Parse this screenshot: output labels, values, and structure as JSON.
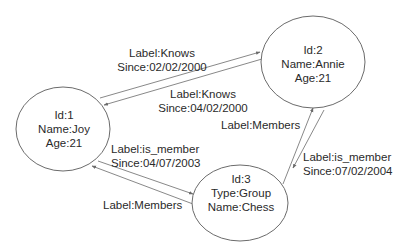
{
  "diagram": {
    "type": "property-graph",
    "nodes": [
      {
        "id": "1",
        "lines": [
          "Id:1",
          "Name:Joy",
          "Age:21"
        ]
      },
      {
        "id": "2",
        "lines": [
          "Id:2",
          "Name:Annie",
          "Age:21"
        ]
      },
      {
        "id": "3",
        "lines": [
          "Id:3",
          "Type:Group",
          "Name:Chess"
        ]
      }
    ],
    "edges": [
      {
        "from": "1",
        "to": "2",
        "lines": [
          "Label:Knows",
          "Since:02/02/2000"
        ]
      },
      {
        "from": "2",
        "to": "1",
        "lines": [
          "Label:Knows",
          "Since:04/02/2000"
        ]
      },
      {
        "from": "1",
        "to": "3",
        "lines": [
          "Label:is_member",
          "Since:04/07/2003"
        ]
      },
      {
        "from": "3",
        "to": "1",
        "lines": [
          "Label:Members"
        ]
      },
      {
        "from": "3",
        "to": "2",
        "lines": [
          "Label:Members"
        ]
      },
      {
        "from": "2",
        "to": "3",
        "lines": [
          "Label:is_member",
          "Since:07/02/2004"
        ]
      }
    ],
    "colors": {
      "stroke": "#6b6b6b",
      "text": "#2a2a2a",
      "background": "#ffffff"
    }
  }
}
